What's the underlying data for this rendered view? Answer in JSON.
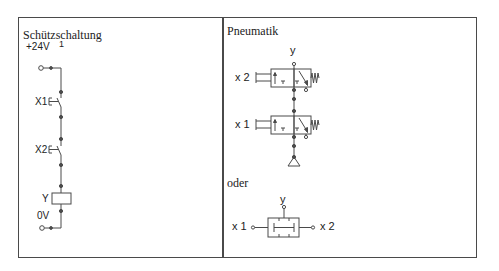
{
  "panels": {
    "left": {
      "title": "Schützschaltung",
      "labels": {
        "supply": "+24V",
        "node": "1",
        "switch1": "X1",
        "switch2": "X2",
        "coil": "Y",
        "ground": "0V"
      }
    },
    "right": {
      "title": "Pneumatik",
      "labels": {
        "output": "y",
        "input2": "x 2",
        "input1": "x 1"
      },
      "alternative": {
        "title": "oder",
        "labels": {
          "output": "y",
          "input1": "x 1",
          "input2": "x 2"
        }
      }
    }
  },
  "colors": {
    "line": "#4a4a4a",
    "text": "#222222"
  }
}
